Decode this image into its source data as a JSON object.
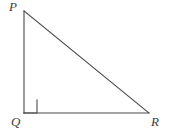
{
  "figure": {
    "background_color": "#ffffff",
    "stroke_color": "#4a4a4a",
    "label_color": "#3d3d3d",
    "stroke_width": 1.1,
    "canvas": {
      "width": 169,
      "height": 134
    }
  },
  "labels": {
    "p": "P",
    "q": "Q",
    "r": "R"
  },
  "vertices": {
    "P": {
      "x": 24,
      "y": 11
    },
    "Q": {
      "x": 24,
      "y": 113
    },
    "R": {
      "x": 149,
      "y": 113
    }
  },
  "right_angle_marker": {
    "at_vertex": "Q",
    "size": 13,
    "x": 24,
    "y": 100
  },
  "edges": [
    {
      "name": "PQ",
      "from": "P",
      "to": "Q",
      "type": "leg",
      "orientation": "vertical"
    },
    {
      "name": "QR",
      "from": "Q",
      "to": "R",
      "type": "leg",
      "orientation": "horizontal"
    },
    {
      "name": "PR",
      "from": "P",
      "to": "R",
      "type": "hypotenuse",
      "orientation": "diagonal"
    }
  ],
  "chart_data": {
    "type": "diagram",
    "shape": "right-triangle",
    "points": [
      {
        "label": "P",
        "x": 24,
        "y": 11
      },
      {
        "label": "Q",
        "x": 24,
        "y": 113
      },
      {
        "label": "R",
        "x": 149,
        "y": 113
      }
    ],
    "segments": [
      "PQ",
      "QR",
      "PR"
    ],
    "right_angle_at": "Q"
  }
}
